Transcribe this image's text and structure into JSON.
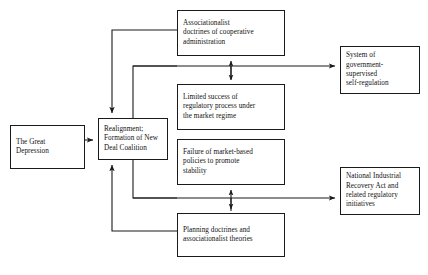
{
  "diagram": {
    "stroke_color": "#1a1a1a",
    "background_color": "#ffffff",
    "nodes": [
      {
        "id": "great-depression",
        "label": "The Great\nDepression"
      },
      {
        "id": "realignment",
        "label": "Realignment;\nFormation of New\nDeal Coalition"
      },
      {
        "id": "associationalist",
        "label": "Associationalist\ndoctrines of cooperative\nadministration"
      },
      {
        "id": "limited-success",
        "label": "Limited success of\nregulatory process under\nthe market regime"
      },
      {
        "id": "failure-market",
        "label": "Failure of market-based\npolicies to promote\nstability"
      },
      {
        "id": "planning-doctrines",
        "label": "Planning doctrines and\nassociationalist theories"
      },
      {
        "id": "self-regulation",
        "label": "System of\ngovernment-\nsupervised\nself-regulation"
      },
      {
        "id": "nira",
        "label": "National Industrial\nRecovery Act and\nrelated regulatory\ninitiatives"
      }
    ],
    "edges": [
      {
        "id": "edge-depression-to-realignment",
        "from": "great-depression",
        "to": "realignment",
        "arrow": "single"
      },
      {
        "id": "edge-associationalist-to-realignment",
        "from": "associationalist",
        "to": "realignment",
        "arrow": "single"
      },
      {
        "id": "edge-limited-success-to-realignment",
        "from": "limited-success",
        "to": "realignment",
        "arrow": "none"
      },
      {
        "id": "edge-failure-market-to-realignment",
        "from": "failure-market",
        "to": "realignment",
        "arrow": "none"
      },
      {
        "id": "edge-planning-to-realignment",
        "from": "planning-doctrines",
        "to": "realignment",
        "arrow": "single"
      },
      {
        "id": "edge-top-to-self-regulation",
        "from": "realignment",
        "to": "self-regulation",
        "arrow": "single"
      },
      {
        "id": "edge-bottom-to-nira",
        "from": "realignment",
        "to": "nira",
        "arrow": "single"
      },
      {
        "id": "edge-associationalist-limited-success",
        "from": "associationalist",
        "to": "limited-success",
        "arrow": "double"
      },
      {
        "id": "edge-failure-planning",
        "from": "failure-market",
        "to": "planning-doctrines",
        "arrow": "double"
      }
    ]
  }
}
